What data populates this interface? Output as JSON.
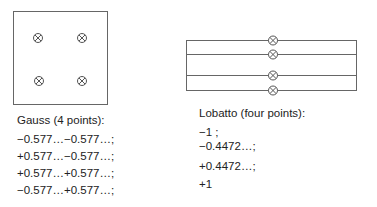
{
  "gauss": {
    "title": "Gauss (4 points):",
    "points": [
      "−0.577…−0.577…;",
      "+0.577…−0.577…;",
      "+0.577…+0.577…;",
      "−0.577…+0.577…;"
    ],
    "square": {
      "x": 13,
      "y": 11,
      "w": 94,
      "h": 93
    },
    "markers": [
      [
        38,
        38
      ],
      [
        82,
        38
      ],
      [
        39,
        81
      ],
      [
        82,
        81
      ]
    ]
  },
  "lobatto": {
    "title": "Lobatto (four points):",
    "points": [
      "−1 ;",
      "−0.4472…;",
      "+0.4472…;",
      "+1"
    ],
    "lines_y": [
      40,
      54,
      75,
      90
    ],
    "x_left": 186,
    "x_right": 356,
    "marker_x": 273
  },
  "colors": {
    "line": "#555555",
    "text": "#222222"
  }
}
